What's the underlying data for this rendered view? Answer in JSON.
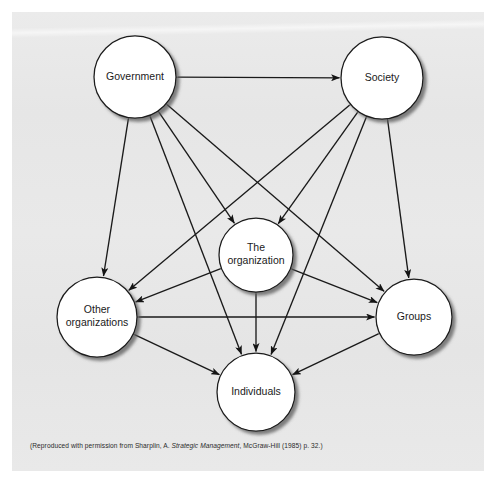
{
  "figure": {
    "panel_bg": "#e8e8e8",
    "circle_fill": "#ffffff",
    "stroke_color": "#1a1a1a"
  },
  "nodes": [
    {
      "id": "government",
      "label": "Government",
      "lines": [
        "Government"
      ],
      "cx": 135,
      "cy": 77,
      "r": 41
    },
    {
      "id": "society",
      "label": "Society",
      "lines": [
        "Society"
      ],
      "cx": 382,
      "cy": 78,
      "r": 41
    },
    {
      "id": "the-organization",
      "label": "The organization",
      "lines": [
        "The",
        "organization"
      ],
      "cx": 256,
      "cy": 255,
      "r": 37
    },
    {
      "id": "other-organizations",
      "label": "Other organizations",
      "lines": [
        "Other",
        "organizations"
      ],
      "cx": 97,
      "cy": 317,
      "r": 40
    },
    {
      "id": "groups",
      "label": "Groups",
      "lines": [
        "Groups"
      ],
      "cx": 414,
      "cy": 317,
      "r": 38
    },
    {
      "id": "individuals",
      "label": "Individuals",
      "lines": [
        "Individuals"
      ],
      "cx": 256,
      "cy": 392,
      "r": 39
    }
  ],
  "edges": [
    {
      "from": "government",
      "to": "society",
      "type": "double-headed"
    },
    {
      "from": "government",
      "to": "the-organization",
      "type": "double-headed"
    },
    {
      "from": "government",
      "to": "other-organizations",
      "type": "double-headed"
    },
    {
      "from": "government",
      "to": "groups",
      "type": "double-headed"
    },
    {
      "from": "government",
      "to": "individuals",
      "type": "double-headed"
    },
    {
      "from": "society",
      "to": "the-organization",
      "type": "double-headed"
    },
    {
      "from": "society",
      "to": "other-organizations",
      "type": "double-headed"
    },
    {
      "from": "society",
      "to": "groups",
      "type": "double-headed"
    },
    {
      "from": "society",
      "to": "individuals",
      "type": "double-headed"
    },
    {
      "from": "the-organization",
      "to": "other-organizations",
      "type": "double-headed"
    },
    {
      "from": "the-organization",
      "to": "groups",
      "type": "double-headed"
    },
    {
      "from": "the-organization",
      "to": "individuals",
      "type": "double-headed"
    },
    {
      "from": "other-organizations",
      "to": "groups",
      "type": "double-headed"
    },
    {
      "from": "other-organizations",
      "to": "individuals",
      "type": "double-headed"
    },
    {
      "from": "groups",
      "to": "individuals",
      "type": "double-headed"
    }
  ],
  "caption": {
    "prefix": "(Reproduced with permission from Sharplin, A. ",
    "italic": "Strategic Management",
    "suffix": ", McGraw-Hill (1985) p. 32.)",
    "full": "(Reproduced with permission from Sharplin, A. Strategic Management, McGraw-Hill (1985) p. 32.)"
  }
}
